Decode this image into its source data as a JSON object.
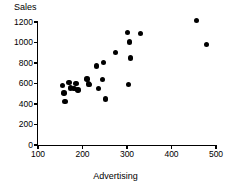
{
  "chart_data": {
    "type": "scatter",
    "title": "",
    "xlabel": "Advertising",
    "ylabel": "Sales",
    "xlim": [
      100,
      500
    ],
    "ylim": [
      0,
      1200
    ],
    "xticks": [
      100,
      200,
      300,
      400,
      500
    ],
    "yticks": [
      0,
      200,
      400,
      600,
      800,
      1000,
      1200
    ],
    "xtick_labels": [
      "100",
      "200",
      "300",
      "400",
      "500"
    ],
    "ytick_labels": [
      "0",
      "200",
      "400",
      "600",
      "800",
      "1000",
      "1200"
    ],
    "grid": false,
    "legend": null,
    "marker": {
      "shape": "circle",
      "color": "#000000",
      "size": 5
    },
    "points": [
      {
        "x": 155,
        "y": 578
      },
      {
        "x": 158,
        "y": 508
      },
      {
        "x": 161,
        "y": 424
      },
      {
        "x": 170,
        "y": 612
      },
      {
        "x": 173,
        "y": 555
      },
      {
        "x": 181,
        "y": 552
      },
      {
        "x": 185,
        "y": 600
      },
      {
        "x": 190,
        "y": 535
      },
      {
        "x": 210,
        "y": 645
      },
      {
        "x": 213,
        "y": 596
      },
      {
        "x": 216,
        "y": 588
      },
      {
        "x": 232,
        "y": 772
      },
      {
        "x": 236,
        "y": 551
      },
      {
        "x": 245,
        "y": 637
      },
      {
        "x": 247,
        "y": 805
      },
      {
        "x": 251,
        "y": 448
      },
      {
        "x": 274,
        "y": 902
      },
      {
        "x": 301,
        "y": 1098
      },
      {
        "x": 303,
        "y": 588
      },
      {
        "x": 306,
        "y": 1004
      },
      {
        "x": 308,
        "y": 848
      },
      {
        "x": 330,
        "y": 1088
      },
      {
        "x": 456,
        "y": 1216
      },
      {
        "x": 479,
        "y": 982
      }
    ]
  }
}
